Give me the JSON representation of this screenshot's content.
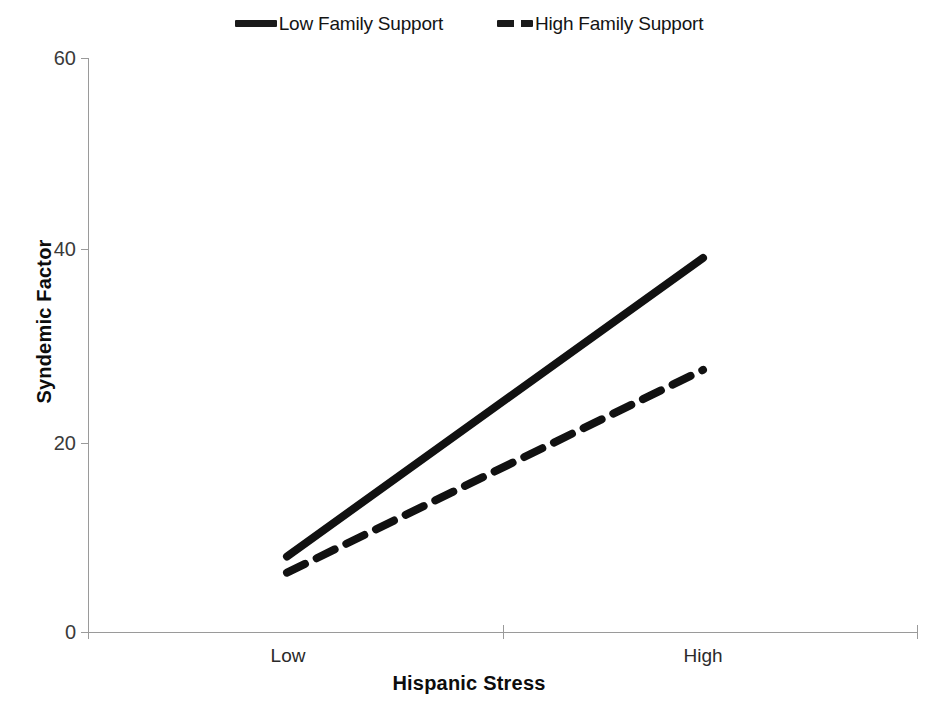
{
  "chart_data": {
    "type": "line",
    "title": "",
    "xlabel": "Hispanic Stress",
    "ylabel": "Syndemic Factor",
    "categories": [
      "Low",
      "High"
    ],
    "x": [
      0,
      1
    ],
    "xlim": [
      -0.48,
      1.52
    ],
    "ylim": [
      0,
      60
    ],
    "yticks": [
      0,
      20,
      40,
      60
    ],
    "ytick_labels": [
      "0",
      "20",
      "40",
      "60"
    ],
    "xtick_labels": [
      "Low",
      "High"
    ],
    "grid": false,
    "legend_position": "top-center",
    "series": [
      {
        "name": "Low Family Support",
        "style": "solid",
        "color": "#111111",
        "values": [
          7.9,
          39.1
        ]
      },
      {
        "name": "High Family Support",
        "style": "dashed",
        "color": "#111111",
        "values": [
          6.2,
          27.4
        ]
      }
    ]
  },
  "legend": {
    "entries": [
      {
        "label": "Low Family Support",
        "style": "solid"
      },
      {
        "label": "High Family Support",
        "style": "dashed"
      }
    ]
  },
  "axes": {
    "y_title": "Syndemic Factor",
    "x_title": "Hispanic Stress",
    "y_tick_0": "0",
    "y_tick_1": "20",
    "y_tick_2": "40",
    "y_tick_3": "60",
    "x_tick_0": "Low",
    "x_tick_1": "High"
  },
  "colors": {
    "line": "#111111",
    "axis": "#9a9a9a",
    "text": "#1a1a1a",
    "background": "#ffffff"
  }
}
